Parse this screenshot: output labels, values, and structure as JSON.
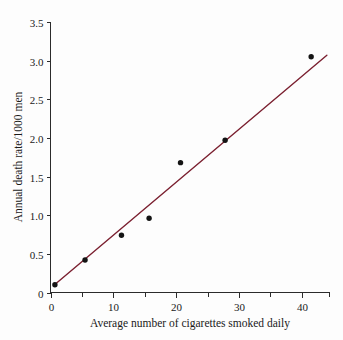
{
  "chart_data": {
    "type": "scatter",
    "title": "",
    "xlabel": "Average number of cigarettes smoked daily",
    "ylabel": "Annual death rate/1000 men",
    "xlim": [
      0,
      44.5
    ],
    "ylim": [
      0,
      3.5
    ],
    "grid": false,
    "legend": "none",
    "x_ticks": [
      0,
      10,
      20,
      30,
      40
    ],
    "x_tick_labels": [
      "0",
      "10",
      "20",
      "30",
      "40"
    ],
    "x_minor_ticks": [
      5,
      15,
      25,
      35
    ],
    "y_ticks": [
      0,
      0.5,
      1.0,
      1.5,
      2.0,
      2.5,
      3.0,
      3.5
    ],
    "y_tick_labels": [
      "0",
      "0.5",
      "1.0",
      "1.5",
      "2.0",
      "2.5",
      "3.0",
      "3.5"
    ],
    "series": [
      {
        "name": "observations",
        "marker": "filled-circle",
        "color": "#141414",
        "points": [
          {
            "x": 0.7,
            "y": 0.1
          },
          {
            "x": 5.5,
            "y": 0.42
          },
          {
            "x": 11.3,
            "y": 0.74
          },
          {
            "x": 15.7,
            "y": 0.96
          },
          {
            "x": 20.7,
            "y": 1.68
          },
          {
            "x": 27.8,
            "y": 1.97
          },
          {
            "x": 41.5,
            "y": 3.05
          }
        ]
      },
      {
        "name": "regression-line",
        "marker": "line",
        "color": "#7B2030",
        "points": [
          {
            "x": 0.5,
            "y": 0.09
          },
          {
            "x": 44.0,
            "y": 3.07
          }
        ]
      }
    ]
  },
  "axes": {
    "x_title": "Average number of cigarettes smoked daily",
    "y_title": "Annual death rate/1000 men",
    "x_tick_labels": [
      "0",
      "10",
      "20",
      "30",
      "40"
    ],
    "y_tick_labels": [
      "0",
      "0.5",
      "1.0",
      "1.5",
      "2.0",
      "2.5",
      "3.0",
      "3.5"
    ]
  },
  "colors": {
    "line": "#7B2030",
    "marker": "#141414",
    "axis": "#2b2b2b",
    "background": "#fdfdfd"
  }
}
